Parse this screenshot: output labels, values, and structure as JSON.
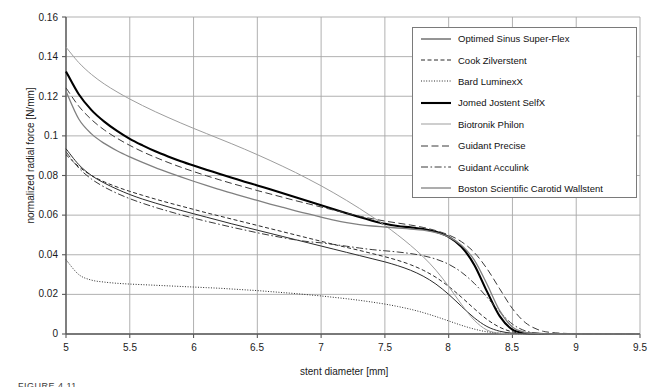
{
  "chart_data": {
    "type": "line",
    "title": "",
    "xlabel": "stent diameter [mm]",
    "ylabel": "normalized radial force [N/mm]",
    "xlim": [
      5,
      9.5
    ],
    "ylim": [
      0,
      0.16
    ],
    "xticks": [
      "5",
      "5.5",
      "6",
      "6.5",
      "7",
      "7.5",
      "8",
      "8.5",
      "9",
      "9.5"
    ],
    "xtick_values": [
      5,
      5.5,
      6,
      6.5,
      7,
      7.5,
      8,
      8.5,
      9,
      9.5
    ],
    "yticks": [
      "0",
      "0.02",
      "0.04",
      "0.06",
      "0.08",
      "0.1",
      "0.12",
      "0.14",
      "0.16"
    ],
    "ytick_values": [
      0,
      0.02,
      0.04,
      0.06,
      0.08,
      0.1,
      0.12,
      0.14,
      0.16
    ],
    "grid": true,
    "legend_position": "upper right",
    "x": [
      5.0,
      5.1,
      5.2,
      5.3,
      5.4,
      5.5,
      5.6,
      5.7,
      5.8,
      5.9,
      6.0,
      6.1,
      6.2,
      6.3,
      6.4,
      6.5,
      6.6,
      6.7,
      6.8,
      6.9,
      7.0,
      7.1,
      7.2,
      7.3,
      7.4,
      7.5,
      7.6,
      7.7,
      7.8,
      7.9,
      8.0,
      8.1,
      8.2,
      8.3,
      8.4,
      8.5,
      8.6,
      8.7,
      8.8,
      9.0,
      9.25,
      9.5
    ],
    "series": [
      {
        "name": "Optimed Sinus Super-Flex",
        "style": "solid",
        "color": "#2b2b2b",
        "width": 1.0,
        "values": [
          0.0935,
          0.0855,
          0.08,
          0.0762,
          0.0731,
          0.0704,
          0.0681,
          0.0661,
          0.0642,
          0.0624,
          0.0607,
          0.059,
          0.0573,
          0.0556,
          0.054,
          0.0524,
          0.0508,
          0.0492,
          0.0476,
          0.046,
          0.0444,
          0.0428,
          0.0412,
          0.0396,
          0.038,
          0.0364,
          0.0345,
          0.0322,
          0.0292,
          0.0252,
          0.02,
          0.014,
          0.0082,
          0.0038,
          0.0014,
          0.0004,
          0.0001,
          0.0,
          0.0,
          0.0,
          0.0,
          0.0
        ]
      },
      {
        "name": "Cook Zilverstent",
        "style": "dashed",
        "color": "#2b2b2b",
        "width": 1.0,
        "values": [
          0.0905,
          0.0845,
          0.08,
          0.0768,
          0.0742,
          0.072,
          0.07,
          0.0681,
          0.0663,
          0.0646,
          0.0629,
          0.0612,
          0.0596,
          0.058,
          0.0564,
          0.0548,
          0.0532,
          0.0516,
          0.05,
          0.0484,
          0.0468,
          0.0452,
          0.0437,
          0.0422,
          0.0406,
          0.039,
          0.0372,
          0.035,
          0.0322,
          0.0286,
          0.024,
          0.0186,
          0.0128,
          0.0074,
          0.0034,
          0.0011,
          0.0003,
          0.0001,
          0.0,
          0.0,
          0.0,
          0.0
        ]
      },
      {
        "name": "Bard LuminexX",
        "style": "dotted",
        "color": "#2b2b2b",
        "width": 1.0,
        "values": [
          0.0375,
          0.03,
          0.0272,
          0.0262,
          0.0256,
          0.0252,
          0.0249,
          0.0246,
          0.0243,
          0.024,
          0.0237,
          0.0234,
          0.0231,
          0.0227,
          0.0223,
          0.0219,
          0.0214,
          0.0209,
          0.0204,
          0.0198,
          0.0192,
          0.0185,
          0.0178,
          0.017,
          0.0161,
          0.0151,
          0.0139,
          0.0125,
          0.0108,
          0.0088,
          0.0066,
          0.0044,
          0.0025,
          0.0011,
          0.0004,
          0.0001,
          0.0,
          0.0,
          0.0,
          0.0,
          0.0,
          0.0
        ]
      },
      {
        "name": "Jomed Jostent SelfX",
        "style": "solid",
        "color": "#000000",
        "width": 2.1,
        "values": [
          0.1325,
          0.121,
          0.113,
          0.1072,
          0.1025,
          0.0985,
          0.0952,
          0.0922,
          0.0896,
          0.0872,
          0.085,
          0.0829,
          0.0809,
          0.0789,
          0.0769,
          0.075,
          0.073,
          0.071,
          0.069,
          0.067,
          0.065,
          0.063,
          0.061,
          0.059,
          0.0572,
          0.0556,
          0.0545,
          0.0538,
          0.053,
          0.0516,
          0.049,
          0.044,
          0.035,
          0.0215,
          0.009,
          0.0022,
          0.0004,
          0.0001,
          0.0,
          0.0,
          0.0,
          0.0
        ]
      },
      {
        "name": "Biotronik Philon",
        "style": "solid",
        "color": "#9d9d9d",
        "width": 1.0,
        "values": [
          0.1448,
          0.137,
          0.131,
          0.1262,
          0.1222,
          0.1186,
          0.1153,
          0.1122,
          0.1093,
          0.1065,
          0.1038,
          0.1012,
          0.0986,
          0.096,
          0.0933,
          0.0905,
          0.0876,
          0.0846,
          0.0815,
          0.0782,
          0.0748,
          0.0712,
          0.0674,
          0.0634,
          0.0592,
          0.0548,
          0.05,
          0.0448,
          0.039,
          0.0322,
          0.024,
          0.015,
          0.007,
          0.002,
          0.0004,
          0.0,
          0.0,
          0.0,
          0.0,
          0.0,
          0.0,
          0.0
        ]
      },
      {
        "name": "Guidant Precise",
        "style": "dashed-long",
        "color": "#3a3a3a",
        "width": 1.0,
        "values": [
          0.1242,
          0.115,
          0.1082,
          0.103,
          0.0988,
          0.0952,
          0.092,
          0.0892,
          0.0866,
          0.0842,
          0.082,
          0.0799,
          0.0779,
          0.076,
          0.0742,
          0.0724,
          0.0707,
          0.069,
          0.0673,
          0.0657,
          0.0641,
          0.0625,
          0.061,
          0.0595,
          0.0582,
          0.057,
          0.056,
          0.055,
          0.0538,
          0.0522,
          0.05,
          0.0466,
          0.0412,
          0.033,
          0.0228,
          0.0128,
          0.0058,
          0.0022,
          0.0008,
          0.0001,
          0.0,
          0.0
        ]
      },
      {
        "name": "Guidant Acculink",
        "style": "dash-dot",
        "color": "#3a3a3a",
        "width": 1.0,
        "values": [
          0.092,
          0.0838,
          0.0782,
          0.0742,
          0.071,
          0.0683,
          0.066,
          0.0639,
          0.062,
          0.0602,
          0.0585,
          0.0569,
          0.0554,
          0.0539,
          0.0525,
          0.0511,
          0.0498,
          0.0486,
          0.0475,
          0.0466,
          0.046,
          0.0452,
          0.0443,
          0.0434,
          0.0426,
          0.042,
          0.0414,
          0.0406,
          0.0395,
          0.0378,
          0.0352,
          0.0312,
          0.0256,
          0.0186,
          0.0112,
          0.005,
          0.0016,
          0.0004,
          0.0001,
          0.0,
          0.0,
          0.0
        ]
      },
      {
        "name": "Boston Scientific Carotid Wallstent",
        "style": "solid",
        "color": "#808080",
        "width": 1.3,
        "values": [
          0.1225,
          0.1085,
          0.101,
          0.0962,
          0.0925,
          0.0894,
          0.0866,
          0.084,
          0.0816,
          0.0793,
          0.0771,
          0.075,
          0.073,
          0.0711,
          0.0692,
          0.0674,
          0.0656,
          0.0639,
          0.0622,
          0.0606,
          0.059,
          0.0575,
          0.0562,
          0.0552,
          0.0545,
          0.054,
          0.0535,
          0.053,
          0.0524,
          0.0512,
          0.049,
          0.0448,
          0.0374,
          0.0252,
          0.0118,
          0.0035,
          0.0008,
          0.0002,
          0.0,
          0.0,
          0.0,
          0.0
        ]
      }
    ]
  },
  "axes": {
    "ylabel": "normalized radial force [N/mm]",
    "xlabel": "stent diameter [mm]"
  },
  "legend": {
    "items": [
      {
        "label": "Optimed Sinus Super-Flex",
        "sample": "solid-thin-dark"
      },
      {
        "label": "Cook Zilverstent",
        "sample": "dashed-dark"
      },
      {
        "label": "Bard LuminexX",
        "sample": "dotted-dark"
      },
      {
        "label": "Jomed Jostent SelfX",
        "sample": "solid-thick-black"
      },
      {
        "label": "Biotronik Philon",
        "sample": "solid-thin-gray"
      },
      {
        "label": "Guidant Precise",
        "sample": "dashed-long-dark"
      },
      {
        "label": "Guidant Acculink",
        "sample": "dash-dot-dark"
      },
      {
        "label": "Boston Scientific Carotid Wallstent",
        "sample": "solid-medium-gray"
      }
    ]
  },
  "footer": {
    "fragment": "FIGURE 4.11"
  }
}
